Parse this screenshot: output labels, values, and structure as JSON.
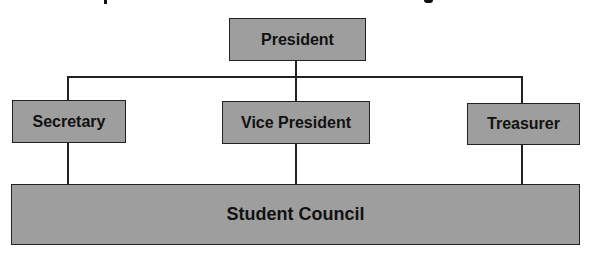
{
  "diagram": {
    "type": "org-chart",
    "colors": {
      "box_fill": "#9e9e9e",
      "border": "#222222",
      "text": "#111111",
      "background": "#ffffff"
    },
    "nodes": [
      {
        "id": "president",
        "label": "President",
        "level": 0
      },
      {
        "id": "secretary",
        "label": "Secretary",
        "level": 1
      },
      {
        "id": "vice_president",
        "label": "Vice President",
        "level": 1
      },
      {
        "id": "treasurer",
        "label": "Treasurer",
        "level": 1
      },
      {
        "id": "student_council",
        "label": "Student Council",
        "level": 2
      }
    ],
    "edges": [
      {
        "from": "president",
        "to": "secretary"
      },
      {
        "from": "president",
        "to": "vice_president"
      },
      {
        "from": "president",
        "to": "treasurer"
      },
      {
        "from": "secretary",
        "to": "student_council"
      },
      {
        "from": "vice_president",
        "to": "student_council"
      },
      {
        "from": "treasurer",
        "to": "student_council"
      }
    ]
  }
}
